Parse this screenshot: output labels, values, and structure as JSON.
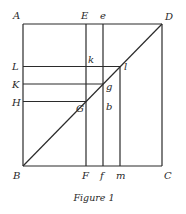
{
  "figure": {
    "caption": "Figure 1",
    "points": {
      "A": "A",
      "B": "B",
      "C": "C",
      "D": "D",
      "E": "E",
      "F": "F",
      "e": "e",
      "f": "f",
      "m": "m",
      "L": "L",
      "K": "K",
      "H": "H",
      "k": "k",
      "l": "l",
      "g": "g",
      "G": "G",
      "b": "b"
    },
    "segments": [
      {
        "name": "square-top-AD",
        "from": "A",
        "to": "D"
      },
      {
        "name": "square-left-AB",
        "from": "A",
        "to": "B"
      },
      {
        "name": "square-bottom-BC",
        "from": "B",
        "to": "C"
      },
      {
        "name": "square-right-DC",
        "from": "D",
        "to": "C"
      },
      {
        "name": "diagonal-BD",
        "from": "B",
        "to": "D"
      },
      {
        "name": "vertical-EF",
        "from": "E",
        "to": "F"
      },
      {
        "name": "vertical-ef",
        "from": "e",
        "to": "f"
      },
      {
        "name": "vertical-lm",
        "from": "l",
        "to": "m"
      },
      {
        "name": "horizontal-Ll",
        "from": "L",
        "to": "l"
      },
      {
        "name": "horizontal-Kg",
        "from": "K",
        "to": "g"
      },
      {
        "name": "horizontal-HG",
        "from": "H",
        "to": "G"
      }
    ]
  }
}
